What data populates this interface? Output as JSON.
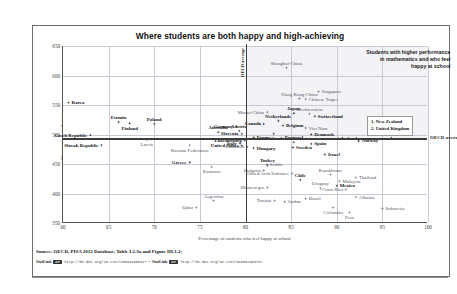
{
  "title": "Where students are both happy and high-achieving",
  "annotation": "Students with higher performance\nin mathematics and who feel\nhappy at school",
  "oecd_vertical_label": "OECD average",
  "oecd_horizontal_label": "OECD average",
  "legend_note": "1. New Zealand\n2. United Kingdom",
  "source": "Source: OECD, PISA 2012 Database, Table I.2.3a and Figure III.1.2:",
  "statlink": {
    "badge": "StatLink",
    "icon": "chain-link-icon",
    "url1": "http://dx.doi.org/10.1787/888932935447",
    "separator": "•",
    "url2": "http://dx.doi.org/10.1787/888932963787"
  },
  "chart_data": {
    "type": "scatter",
    "title": "Where students are both happy and high-achieving",
    "xlabel": "Percentage of students who feel happy at school",
    "ylabel": "Mean score in mathematics",
    "xlim": [
      60,
      100
    ],
    "ylim": [
      350,
      650
    ],
    "xticks": [
      60,
      65,
      70,
      75,
      80,
      85,
      90,
      95,
      100
    ],
    "yticks": [
      350,
      400,
      450,
      500,
      550,
      600,
      650
    ],
    "grid": true,
    "legend_position": "right",
    "oecd_average_x": 80.0,
    "oecd_average_y": 494,
    "points": [
      {
        "name": "Korea",
        "x": 60.6,
        "y": 554,
        "label_pos": "right",
        "style": "bold"
      },
      {
        "name": "Czech Republic",
        "x": 63.0,
        "y": 499,
        "label_pos": "left",
        "style": "bold"
      },
      {
        "name": "Slovak Republic",
        "x": 64.2,
        "y": 482,
        "label_pos": "left",
        "style": "bold"
      },
      {
        "name": "Estonia",
        "x": 66.1,
        "y": 521,
        "label_pos": "above",
        "style": "bold"
      },
      {
        "name": "Finland",
        "x": 67.3,
        "y": 519,
        "label_pos": "below",
        "style": "bold"
      },
      {
        "name": "Poland",
        "x": 70.0,
        "y": 518,
        "label_pos": "above",
        "style": "bold"
      },
      {
        "name": "Latvia",
        "x": 69.2,
        "y": 491,
        "label_pos": "below",
        "style": "muted"
      },
      {
        "name": "Russian Federation",
        "x": 73.9,
        "y": 482,
        "label_pos": "below",
        "style": "muted"
      },
      {
        "name": "Greece",
        "x": 73.9,
        "y": 453,
        "label_pos": "left",
        "style": "bold"
      },
      {
        "name": "Romania",
        "x": 76.3,
        "y": 445,
        "label_pos": "below",
        "style": "muted"
      },
      {
        "name": "Argentina",
        "x": 76.5,
        "y": 388,
        "label_pos": "above",
        "style": "muted"
      },
      {
        "name": "Qatar",
        "x": 74.6,
        "y": 376,
        "label_pos": "left",
        "style": "muted"
      },
      {
        "name": "Australia",
        "x": 77.0,
        "y": 504,
        "label_pos": "above",
        "style": "bold"
      },
      {
        "name": "Austria",
        "x": 79.3,
        "y": 506,
        "label_pos": "above",
        "style": "bold"
      },
      {
        "name": "Germany",
        "x": 79.0,
        "y": 514,
        "label_pos": "left",
        "style": "bold"
      },
      {
        "name": "Slovenia",
        "x": 79.6,
        "y": 501,
        "label_pos": "left",
        "style": "bold"
      },
      {
        "name": "Luxembourg",
        "x": 79.9,
        "y": 490,
        "label_pos": "left",
        "style": "bold"
      },
      {
        "name": "Italy",
        "x": 79.4,
        "y": 485,
        "label_pos": "left",
        "style": "bold"
      },
      {
        "name": "Lithuania",
        "x": 80.2,
        "y": 479,
        "label_pos": "left",
        "style": "muted"
      },
      {
        "name": "United States",
        "x": 79.6,
        "y": 481,
        "label_pos": "left",
        "style": "bold"
      },
      {
        "name": "France",
        "x": 80.9,
        "y": 495,
        "label_pos": "right",
        "style": "bold"
      },
      {
        "name": "Hungary",
        "x": 80.9,
        "y": 477,
        "label_pos": "right",
        "style": "bold"
      },
      {
        "name": "Turkey",
        "x": 82.4,
        "y": 448,
        "label_pos": "above",
        "style": "bold"
      },
      {
        "name": "Serbia",
        "x": 82.3,
        "y": 449,
        "label_pos": "right",
        "style": "muted"
      },
      {
        "name": "Bulgaria",
        "x": 82.0,
        "y": 439,
        "label_pos": "left",
        "style": "muted"
      },
      {
        "name": "Montenegro",
        "x": 82.4,
        "y": 410,
        "label_pos": "left",
        "style": "muted"
      },
      {
        "name": "Tunisia",
        "x": 83.2,
        "y": 388,
        "label_pos": "left",
        "style": "muted"
      },
      {
        "name": "Jordan",
        "x": 84.3,
        "y": 386,
        "label_pos": "right",
        "style": "muted"
      },
      {
        "name": "Canada",
        "x": 82.0,
        "y": 518,
        "label_pos": "left",
        "style": "bold"
      },
      {
        "name": "Ireland",
        "x": 83.1,
        "y": 501,
        "label_pos": "below",
        "style": "bold"
      },
      {
        "name": "Belgium",
        "x": 84.1,
        "y": 515,
        "label_pos": "right",
        "style": "bold"
      },
      {
        "name": "Netherlands",
        "x": 83.6,
        "y": 523,
        "label_pos": "above",
        "style": "bold"
      },
      {
        "name": "Macao-China",
        "x": 82.4,
        "y": 538,
        "label_pos": "left",
        "style": "muted"
      },
      {
        "name": "Shanghai-China",
        "x": 84.5,
        "y": 613,
        "label_pos": "above",
        "style": "muted"
      },
      {
        "name": "Hong Kong-China",
        "x": 85.9,
        "y": 561,
        "label_pos": "above",
        "style": "muted"
      },
      {
        "name": "Japan",
        "x": 85.3,
        "y": 536,
        "label_pos": "above",
        "style": "bold"
      },
      {
        "name": "Singapore",
        "x": 88.0,
        "y": 573,
        "label_pos": "right",
        "style": "muted"
      },
      {
        "name": "Chinese Taipei",
        "x": 86.6,
        "y": 560,
        "label_pos": "right",
        "style": "muted"
      },
      {
        "name": "Liechtenstein",
        "x": 87.0,
        "y": 535,
        "label_pos": "above",
        "style": "muted"
      },
      {
        "name": "Switzerland",
        "x": 87.6,
        "y": 531,
        "label_pos": "right",
        "style": "bold"
      },
      {
        "name": "Viet Nam",
        "x": 86.6,
        "y": 511,
        "label_pos": "right",
        "style": "muted"
      },
      {
        "name": "Denmark",
        "x": 87.2,
        "y": 500,
        "label_pos": "right",
        "style": "bold"
      },
      {
        "name": "Iceland",
        "x": 90.2,
        "y": 493,
        "label_pos": "right",
        "style": "bold"
      },
      {
        "name": "Portugal",
        "x": 85.3,
        "y": 487,
        "label_pos": "above",
        "style": "bold"
      },
      {
        "name": "Spain",
        "x": 87.2,
        "y": 484,
        "label_pos": "right",
        "style": "bold"
      },
      {
        "name": "Sweden",
        "x": 85.2,
        "y": 478,
        "label_pos": "right",
        "style": "bold"
      },
      {
        "name": "Israel",
        "x": 88.7,
        "y": 466,
        "label_pos": "right",
        "style": "bold"
      },
      {
        "name": "Norway",
        "x": 92.4,
        "y": 489,
        "label_pos": "right",
        "style": "bold"
      },
      {
        "name": "New Zealand",
        "x": 95.0,
        "y": 500,
        "label_pos": "num1",
        "style": "bold"
      },
      {
        "name": "United Kingdom",
        "x": 96.0,
        "y": 494,
        "label_pos": "num2",
        "style": "bold"
      },
      {
        "name": "United Arab Emirates",
        "x": 85.1,
        "y": 434,
        "label_pos": "left",
        "style": "muted"
      },
      {
        "name": "Chile",
        "x": 86.0,
        "y": 423,
        "label_pos": "above",
        "style": "bold"
      },
      {
        "name": "Uruguay",
        "x": 88.2,
        "y": 409,
        "label_pos": "above",
        "style": "muted"
      },
      {
        "name": "Brazil",
        "x": 86.6,
        "y": 391,
        "label_pos": "right",
        "style": "muted"
      },
      {
        "name": "Kazakhstan",
        "x": 89.3,
        "y": 432,
        "label_pos": "above",
        "style": "muted"
      },
      {
        "name": "Thailand",
        "x": 92.1,
        "y": 427,
        "label_pos": "right",
        "style": "muted"
      },
      {
        "name": "Malaysia",
        "x": 90.3,
        "y": 421,
        "label_pos": "right",
        "style": "muted"
      },
      {
        "name": "Mexico",
        "x": 90.0,
        "y": 413,
        "label_pos": "right",
        "style": "bold"
      },
      {
        "name": "Costa Rica",
        "x": 91.0,
        "y": 407,
        "label_pos": "left",
        "style": "muted"
      },
      {
        "name": "Albania",
        "x": 92.1,
        "y": 394,
        "label_pos": "right",
        "style": "muted"
      },
      {
        "name": "Colombia",
        "x": 89.6,
        "y": 376,
        "label_pos": "below",
        "style": "muted"
      },
      {
        "name": "Peru",
        "x": 91.4,
        "y": 368,
        "label_pos": "below",
        "style": "muted"
      },
      {
        "name": "Indonesia",
        "x": 95.0,
        "y": 375,
        "label_pos": "right",
        "style": "muted"
      }
    ]
  }
}
